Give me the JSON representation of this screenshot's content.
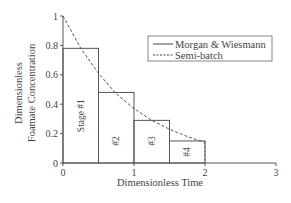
{
  "chart_data": {
    "type": "line",
    "title": "",
    "xlabel": "Dimensionless Time",
    "ylabel": [
      "Dimensionless",
      "Foamate Concentration"
    ],
    "xlim": [
      0,
      3
    ],
    "ylim": [
      0,
      1
    ],
    "x_ticks": [
      "0",
      "1",
      "2",
      "3"
    ],
    "y_ticks": [
      "0",
      "0.2",
      "0.4",
      "0.6",
      "0.8",
      "1"
    ],
    "grid": false,
    "legend_position": "upper right",
    "series": [
      {
        "name": "Morgan & Wiesmann",
        "style": "solid",
        "kind": "step",
        "stages": [
          {
            "label": "Stage #1",
            "x_start": 0.0,
            "x_end": 0.5,
            "value": 0.78
          },
          {
            "label": "#2",
            "x_start": 0.5,
            "x_end": 1.0,
            "value": 0.48
          },
          {
            "label": "#3",
            "x_start": 1.0,
            "x_end": 1.5,
            "value": 0.29
          },
          {
            "label": "#4",
            "x_start": 1.5,
            "x_end": 2.0,
            "value": 0.15
          }
        ]
      },
      {
        "name": "Semi-batch",
        "style": "dashed",
        "kind": "curve",
        "x": [
          0,
          0.25,
          0.5,
          0.75,
          1.0,
          1.25,
          1.5,
          1.75,
          2.0
        ],
        "values": [
          1.0,
          0.78,
          0.61,
          0.47,
          0.37,
          0.29,
          0.23,
          0.18,
          0.14
        ]
      }
    ]
  },
  "legend": {
    "items": [
      {
        "label": "Morgan & Wiesmann",
        "style": "solid"
      },
      {
        "label": "Semi-batch",
        "style": "dashed"
      }
    ]
  },
  "colors": {
    "line": "#444444",
    "text": "#444444",
    "background": "#ffffff"
  }
}
